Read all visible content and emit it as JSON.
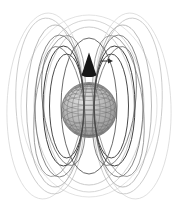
{
  "figure": {
    "type": "magnetic-dipole-field-3d-plot",
    "background_color": "#ffffff",
    "canvas": {
      "width": 177,
      "height": 210
    },
    "sphere": {
      "cx": 89,
      "cy": 110,
      "r": 27.5,
      "edge_color": "#6a6a6a",
      "edge_width": 0.7,
      "grid_color": "#6e6e6e",
      "grid_width": 0.45,
      "pole_factor": 0.94,
      "lat_flatten": 0.34,
      "latitudes_deg": [
        80,
        70,
        60,
        50,
        40,
        30,
        20,
        10,
        -10,
        -20,
        -30,
        -45,
        -60
      ],
      "longitude_rx_fractions": [
        0.16,
        0.4,
        0.62,
        0.8,
        0.93,
        1.0
      ],
      "gradient": [
        {
          "offset": "0%",
          "color": "#e2e2e2"
        },
        {
          "offset": "45%",
          "color": "#b8b8b8"
        },
        {
          "offset": "80%",
          "color": "#969696"
        },
        {
          "offset": "100%",
          "color": "#828282"
        }
      ]
    },
    "back_loops": [
      {
        "cx": 89,
        "cy": 106,
        "rx": 68,
        "ry": 91,
        "rot": 0,
        "color": "#dadada",
        "w": 0.8
      },
      {
        "cx": 89,
        "cy": 106,
        "rx": 55,
        "ry": 86,
        "rot": 0,
        "color": "#d0d0d0",
        "w": 0.9
      },
      {
        "cx": 89,
        "cy": 106,
        "rx": 45,
        "ry": 79,
        "rot": 0,
        "color": "#c4c4c4",
        "w": 0.9
      },
      {
        "cx": 45.5,
        "cy": 106,
        "rx": 38.5,
        "ry": 93,
        "rot": 2,
        "color": "#d8d8d8",
        "w": 0.8
      },
      {
        "cx": 132.5,
        "cy": 106,
        "rx": 38.5,
        "ry": 93,
        "rot": -2,
        "color": "#d8d8d8",
        "w": 0.8
      },
      {
        "cx": 50,
        "cy": 106,
        "rx": 34,
        "ry": 88,
        "rot": -3,
        "color": "#c8c8c8",
        "w": 0.9
      },
      {
        "cx": 128,
        "cy": 106,
        "rx": 34,
        "ry": 88,
        "rot": 3,
        "color": "#c8c8c8",
        "w": 0.9
      },
      {
        "cx": 55.25,
        "cy": 106,
        "rx": 28.75,
        "ry": 81,
        "rot": 0,
        "color": "#b2b2b2",
        "w": 0.9
      },
      {
        "cx": 122.75,
        "cy": 106,
        "rx": 28.75,
        "ry": 81,
        "rot": 0,
        "color": "#b2b2b2",
        "w": 0.9
      }
    ],
    "front_loops": [
      {
        "cx": 59.5,
        "cy": 106,
        "rx": 24.5,
        "ry": 71,
        "rot": 7,
        "color": "#8d8d8d",
        "w": 0.8
      },
      {
        "cx": 118.5,
        "cy": 106,
        "rx": 24.5,
        "ry": 71,
        "rot": -7,
        "color": "#8d8d8d",
        "w": 0.8
      },
      {
        "cx": 63.5,
        "cy": 106,
        "rx": 20.5,
        "ry": 60,
        "rot": -8,
        "color": "#6f6f6f",
        "w": 0.8
      },
      {
        "cx": 114.5,
        "cy": 106,
        "rx": 20.5,
        "ry": 60,
        "rot": 8,
        "color": "#6f6f6f",
        "w": 0.8
      },
      {
        "cx": 59.5,
        "cy": 106,
        "rx": 24.5,
        "ry": 71,
        "rot": 0,
        "color": "#787878",
        "w": 0.9
      },
      {
        "cx": 118.5,
        "cy": 106,
        "rx": 24.5,
        "ry": 71,
        "rot": 0,
        "color": "#787878",
        "w": 0.9
      },
      {
        "cx": 63.5,
        "cy": 106,
        "rx": 20.5,
        "ry": 60,
        "rot": 0,
        "color": "#3f3f3f",
        "w": 1
      },
      {
        "cx": 114.5,
        "cy": 106,
        "rx": 20.5,
        "ry": 60,
        "rot": 0,
        "color": "#3f3f3f",
        "w": 1
      },
      {
        "cx": 66.75,
        "cy": 106,
        "rx": 17.25,
        "ry": 52,
        "rot": 0,
        "color": "#4a4a4a",
        "w": 1
      },
      {
        "cx": 111.25,
        "cy": 106,
        "rx": 17.25,
        "ry": 52,
        "rot": 0,
        "color": "#4a4a4a",
        "w": 1
      },
      {
        "cx": 89,
        "cy": 106,
        "rx": 28,
        "ry": 68,
        "rot": 0,
        "color": "#5a5a5a",
        "w": 0.9
      }
    ],
    "moment_arrow": {
      "cx": 89,
      "tip_y": 52.5,
      "base_y": 74.5,
      "base_rx": 7.2,
      "base_ry": 2.6,
      "color": "#161616",
      "base_color": "#000000"
    },
    "direction_arrow": {
      "x1": 100.5,
      "x2": 108.5,
      "y": 61,
      "w": 1,
      "head_length": 4.5,
      "head_halfwidth": 2.4,
      "color": "#2b2b2b"
    }
  }
}
